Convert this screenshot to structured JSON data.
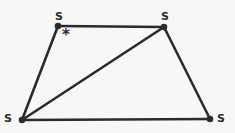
{
  "figure": {
    "type": "geometry-diagram",
    "shape": "trapezoid-with-diagonal",
    "background_color": "#f7f7f5",
    "stroke_color": "#2b2b2b",
    "stroke_width": 2.4,
    "vertex_dot_radius": 3.2,
    "vertices": [
      {
        "id": "top-left",
        "label": "S",
        "x": 58,
        "y": 26
      },
      {
        "id": "top-right",
        "label": "S",
        "x": 164,
        "y": 27
      },
      {
        "id": "bottom-right",
        "label": "S",
        "x": 210,
        "y": 119
      },
      {
        "id": "bottom-left",
        "label": "S",
        "x": 22,
        "y": 120
      }
    ],
    "edges": [
      {
        "id": "top-edge",
        "from": "top-left",
        "to": "top-right"
      },
      {
        "id": "right-edge",
        "from": "top-right",
        "to": "bottom-right"
      },
      {
        "id": "bottom-edge",
        "from": "bottom-right",
        "to": "bottom-left"
      },
      {
        "id": "left-edge",
        "from": "bottom-left",
        "to": "top-left"
      }
    ],
    "diagonal": {
      "id": "diagonal",
      "from": "bottom-left",
      "to": "top-right"
    },
    "annotations": [
      {
        "id": "angle-asterisk",
        "text": "*",
        "x": 66,
        "y": 34
      }
    ],
    "labels": {
      "top_left": "S",
      "top_right": "S",
      "bottom_left": "S",
      "bottom_right": "S"
    }
  }
}
